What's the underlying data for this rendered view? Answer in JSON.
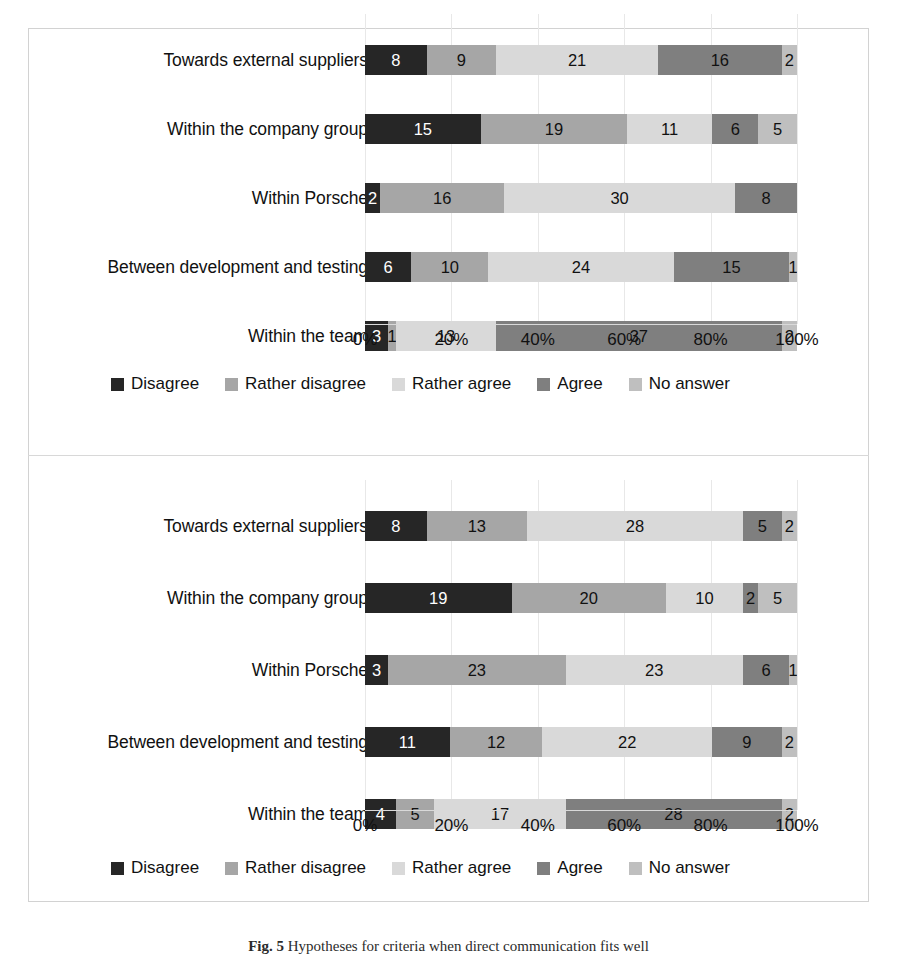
{
  "figure": {
    "caption_prefix": "Fig. 5",
    "caption_text": "Hypotheses for criteria when direct communication fits well",
    "frame_color": "#d2d2d2"
  },
  "legend": {
    "items": [
      {
        "label": "Disagree",
        "color": "#262626"
      },
      {
        "label": "Rather disagree",
        "color": "#a6a6a6"
      },
      {
        "label": "Rather agree",
        "color": "#d9d9d9"
      },
      {
        "label": "Agree",
        "color": "#7f7f7f"
      },
      {
        "label": "No answer",
        "color": "#bfbfbf"
      }
    ]
  },
  "axis": {
    "ticks": [
      "0%",
      "20%",
      "40%",
      "60%",
      "80%",
      "100%"
    ],
    "min": 0,
    "max": 100
  },
  "chart_data": [
    {
      "type": "bar",
      "orientation": "horizontal",
      "stacked": true,
      "normalized": "100%",
      "title": "",
      "xlabel": "",
      "ylabel": "",
      "xlim": [
        0,
        100
      ],
      "xticks": [
        "0%",
        "20%",
        "40%",
        "60%",
        "80%",
        "100%"
      ],
      "grid": true,
      "legend_position": "bottom",
      "categories": [
        "Towards external suppliers",
        "Within the company group",
        "Within Porsche",
        "Between development and testing",
        "Within the team"
      ],
      "series": [
        {
          "name": "Disagree",
          "color": "#262626",
          "values": [
            8,
            15,
            2,
            6,
            3
          ]
        },
        {
          "name": "Rather disagree",
          "color": "#a6a6a6",
          "values": [
            9,
            19,
            16,
            10,
            1
          ]
        },
        {
          "name": "Rather agree",
          "color": "#d9d9d9",
          "values": [
            21,
            11,
            30,
            24,
            13
          ]
        },
        {
          "name": "Agree",
          "color": "#7f7f7f",
          "values": [
            16,
            6,
            8,
            15,
            37
          ]
        },
        {
          "name": "No answer",
          "color": "#bfbfbf",
          "values": [
            2,
            5,
            0,
            1,
            2
          ]
        }
      ],
      "row_totals": [
        56,
        56,
        56,
        56,
        56
      ]
    },
    {
      "type": "bar",
      "orientation": "horizontal",
      "stacked": true,
      "normalized": "100%",
      "title": "",
      "xlabel": "",
      "ylabel": "",
      "xlim": [
        0,
        100
      ],
      "xticks": [
        "0%",
        "20%",
        "40%",
        "60%",
        "80%",
        "100%"
      ],
      "grid": true,
      "legend_position": "bottom",
      "categories": [
        "Towards external suppliers",
        "Within the company group",
        "Within Porsche",
        "Between development and testing",
        "Within the team"
      ],
      "series": [
        {
          "name": "Disagree",
          "color": "#262626",
          "values": [
            8,
            19,
            3,
            11,
            4
          ]
        },
        {
          "name": "Rather disagree",
          "color": "#a6a6a6",
          "values": [
            13,
            20,
            23,
            12,
            5
          ]
        },
        {
          "name": "Rather agree",
          "color": "#d9d9d9",
          "values": [
            28,
            10,
            23,
            22,
            17
          ]
        },
        {
          "name": "Agree",
          "color": "#7f7f7f",
          "values": [
            5,
            2,
            6,
            9,
            28
          ]
        },
        {
          "name": "No answer",
          "color": "#bfbfbf",
          "values": [
            2,
            5,
            1,
            2,
            2
          ]
        }
      ],
      "row_totals": [
        56,
        56,
        56,
        56,
        56
      ]
    }
  ]
}
